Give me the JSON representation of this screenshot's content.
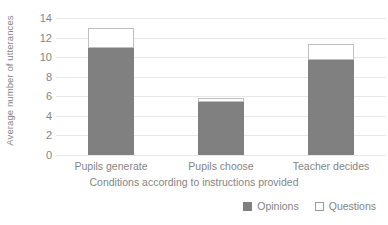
{
  "chart_data": {
    "type": "bar",
    "subtype": "stacked-vertical-bar",
    "title": "",
    "xlabel": "Conditions according to instructions provided",
    "ylabel": "Average number of utterances",
    "categories": [
      "Pupils generate",
      "Pupils choose",
      "Teacher decides"
    ],
    "series": [
      {
        "name": "Opinions",
        "color": "#808080",
        "values": [
          10.9,
          5.4,
          9.7
        ]
      },
      {
        "name": "Questions",
        "color": "#ffffff",
        "values": [
          2.1,
          0.4,
          1.6
        ]
      }
    ],
    "totals": [
      13.0,
      5.8,
      11.3
    ],
    "ylim": [
      0,
      14
    ],
    "ytick_step": 2,
    "yticks": [
      "0",
      "2",
      "4",
      "6",
      "8",
      "10",
      "12",
      "14"
    ],
    "grid": true,
    "grid_axis": "y",
    "legend_position": "bottom-right"
  },
  "legend": {
    "items": [
      {
        "label": "Opinions",
        "style": "filled"
      },
      {
        "label": "Questions",
        "style": "hollow"
      }
    ]
  }
}
